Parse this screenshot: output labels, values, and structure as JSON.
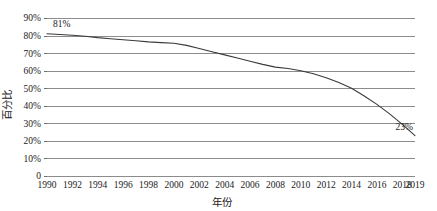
{
  "chart_data": {
    "type": "line",
    "title": "",
    "xlabel": "年份",
    "ylabel": "百分比",
    "grid": true,
    "legend": false,
    "ylim": [
      0,
      90
    ],
    "xlim": [
      1990,
      2019
    ],
    "ytick_labels": [
      "90%",
      "80%",
      "70%",
      "60%",
      "50%",
      "40%",
      "30%",
      "20%",
      "10%",
      "0"
    ],
    "ytick_values": [
      90,
      80,
      70,
      60,
      50,
      40,
      30,
      20,
      10,
      0
    ],
    "xtick_labels": [
      "1990",
      "1992",
      "1994",
      "1996",
      "1998",
      "2000",
      "2002",
      "2004",
      "2006",
      "2008",
      "2010",
      "2012",
      "2014",
      "2016",
      "2018",
      "2019"
    ],
    "xtick_values": [
      1990,
      1992,
      1994,
      1996,
      1998,
      2000,
      2002,
      2004,
      2006,
      2008,
      2010,
      2012,
      2014,
      2016,
      2018,
      2019
    ],
    "series": [
      {
        "name": "百分比",
        "color": "#3a3a3a",
        "x": [
          1990,
          1991,
          1992,
          1993,
          1994,
          1995,
          1996,
          1997,
          1998,
          1999,
          2000,
          2001,
          2002,
          2003,
          2004,
          2005,
          2006,
          2007,
          2008,
          2009,
          2010,
          2011,
          2012,
          2013,
          2014,
          2015,
          2016,
          2017,
          2018,
          2019
        ],
        "values": [
          81,
          80.6,
          80.2,
          79.6,
          78.8,
          78.2,
          77.6,
          77.0,
          76.4,
          76.0,
          75.6,
          74.4,
          72.6,
          70.8,
          69.0,
          67.2,
          65.4,
          63.6,
          62.0,
          61.2,
          60.0,
          58.2,
          56.0,
          53.2,
          50.0,
          45.6,
          40.8,
          35.4,
          29.4,
          23
        ]
      }
    ],
    "annotations": [
      {
        "text": "81%",
        "x": 1990,
        "y": 81,
        "position": "above-right"
      },
      {
        "text": "23%",
        "x": 2019,
        "y": 23,
        "position": "above-right"
      }
    ],
    "colors": {
      "line": "#3a3a3a",
      "grid": "#8c8c8c",
      "axis": "#6e6e6e",
      "background": "#ffffff",
      "text": "#1a1a1a"
    }
  }
}
